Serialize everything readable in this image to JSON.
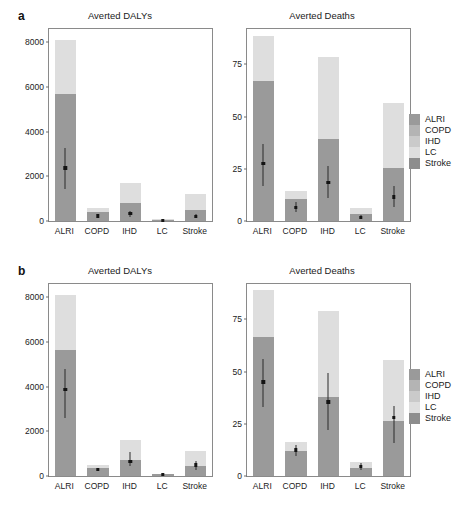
{
  "figure": {
    "panel_rows": [
      {
        "letter": "a"
      },
      {
        "letter": "b"
      }
    ]
  },
  "legend": {
    "items": [
      {
        "label": "ALRI",
        "color": "#9a9a9a"
      },
      {
        "label": "COPD",
        "color": "#b4b4b4"
      },
      {
        "label": "IHD",
        "color": "#cacaca"
      },
      {
        "label": "LC",
        "color": "#dedede"
      },
      {
        "label": "Stroke",
        "color": "#8d8d8d"
      }
    ]
  },
  "chart_data": [
    {
      "type": "bar",
      "panel": "a",
      "title": "Averted DALYs",
      "xlabel": "",
      "ylabel": "",
      "categories": [
        "ALRI",
        "COPD",
        "IHD",
        "LC",
        "Stroke"
      ],
      "yticks": [
        0,
        2000,
        4000,
        6000,
        8000
      ],
      "ylim": [
        0,
        8600
      ],
      "grid": false,
      "legend_position": "right",
      "series": [
        {
          "name": "upper-range",
          "values": [
            8100,
            560,
            1680,
            100,
            1200
          ]
        },
        {
          "name": "mid-range",
          "values": [
            5680,
            390,
            790,
            60,
            500
          ]
        }
      ],
      "point_estimates": [
        2380,
        230,
        330,
        30,
        205
      ],
      "error_low": [
        1450,
        150,
        190,
        15,
        120
      ],
      "error_high": [
        3250,
        330,
        470,
        50,
        300
      ]
    },
    {
      "type": "bar",
      "panel": "a",
      "title": "Averted Deaths",
      "xlabel": "",
      "ylabel": "",
      "categories": [
        "ALRI",
        "COPD",
        "IHD",
        "LC",
        "Stroke"
      ],
      "yticks": [
        0,
        25,
        50,
        75
      ],
      "ylim": [
        0,
        92
      ],
      "grid": false,
      "legend_position": "right",
      "series": [
        {
          "name": "upper-range",
          "values": [
            88.5,
            14.5,
            78.5,
            6.0,
            56.5
          ]
        },
        {
          "name": "mid-range",
          "values": [
            67.0,
            10.5,
            39.5,
            3.5,
            25.5
          ]
        }
      ],
      "point_estimates": [
        27.5,
        6.5,
        18.5,
        1.8,
        11.5
      ],
      "error_low": [
        17.0,
        4.5,
        11.0,
        0.8,
        6.5
      ],
      "error_high": [
        37.0,
        9.0,
        26.5,
        3.0,
        17.0
      ]
    },
    {
      "type": "bar",
      "panel": "b",
      "title": "Averted DALYs",
      "xlabel": "",
      "ylabel": "",
      "categories": [
        "ALRI",
        "COPD",
        "IHD",
        "LC",
        "Stroke"
      ],
      "yticks": [
        0,
        2000,
        4000,
        6000,
        8000
      ],
      "ylim": [
        0,
        8600
      ],
      "grid": false,
      "legend_position": "right",
      "series": [
        {
          "name": "upper-range",
          "values": [
            8120,
            490,
            1620,
            110,
            1140
          ]
        },
        {
          "name": "mid-range",
          "values": [
            5640,
            350,
            700,
            70,
            470
          ]
        }
      ],
      "point_estimates": [
        3880,
        300,
        650,
        55,
        490
      ],
      "error_low": [
        2580,
        230,
        430,
        30,
        280
      ],
      "error_high": [
        4800,
        370,
        1080,
        80,
        660
      ]
    },
    {
      "type": "bar",
      "panel": "b",
      "title": "Averted Deaths",
      "xlabel": "",
      "ylabel": "",
      "categories": [
        "ALRI",
        "COPD",
        "IHD",
        "LC",
        "Stroke"
      ],
      "yticks": [
        0,
        25,
        50,
        75
      ],
      "ylim": [
        0,
        92
      ],
      "grid": false,
      "legend_position": "right",
      "series": [
        {
          "name": "upper-range",
          "values": [
            89.0,
            16.5,
            79.0,
            6.5,
            55.5
          ]
        },
        {
          "name": "mid-range",
          "values": [
            66.5,
            12.0,
            38.0,
            4.0,
            26.5
          ]
        }
      ],
      "point_estimates": [
        45.0,
        12.5,
        35.5,
        4.5,
        28.0
      ],
      "error_low": [
        33.0,
        9.5,
        22.0,
        3.0,
        16.0
      ],
      "error_high": [
        56.0,
        15.0,
        49.5,
        6.0,
        33.5
      ]
    }
  ]
}
